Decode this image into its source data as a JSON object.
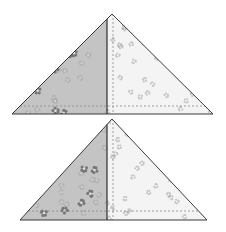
{
  "diagram": {
    "title": "Half-square triangle quilt pieces",
    "background": "#ffffff",
    "colors": {
      "dark_fabric": "#c4c4c4",
      "light_fabric": "#f4f4f4",
      "dark_flower": "#6a6a6a",
      "dark_flower_soft": "#a8a8a8",
      "light_flower": "#a0a0a0",
      "outline": "#3a3a3a",
      "seam": "#2e2e2e",
      "dotted": "#8a8a8a"
    },
    "triangles": [
      {
        "name": "top-triangle",
        "apex": [
          112,
          14
        ],
        "base_left": [
          12,
          114
        ],
        "base_right": [
          213,
          114
        ],
        "seam_x": 107,
        "dotted_vertical_x": 113,
        "dotted_horizontal_y": 106
      },
      {
        "name": "bottom-triangle",
        "apex": [
          112,
          119
        ],
        "base_left": [
          20,
          220
        ],
        "base_right": [
          207,
          220
        ],
        "seam_x": 107,
        "dotted_vertical_x": 113,
        "dotted_horizontal_y": 211
      }
    ]
  }
}
